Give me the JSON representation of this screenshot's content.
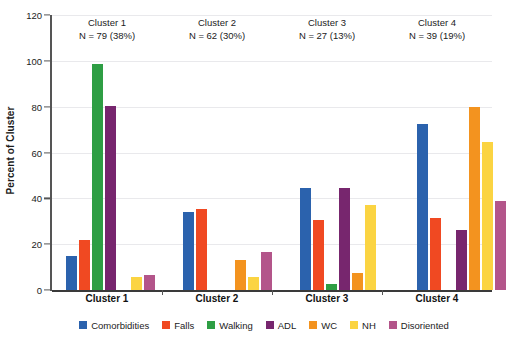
{
  "chart_data": {
    "type": "bar",
    "title": "",
    "subtitle": "",
    "xlabel": "",
    "ylabel": "Percent of Cluster",
    "ylim": [
      0,
      120
    ],
    "yticks": [
      0,
      20,
      40,
      60,
      80,
      100,
      120
    ],
    "grid": true,
    "legend_position": "bottom",
    "categories": [
      "Cluster 1",
      "Cluster 2",
      "Cluster 3",
      "Cluster 4"
    ],
    "annotations": [
      {
        "line1": "Cluster 1",
        "line2": "N = 79 (38%)"
      },
      {
        "line1": "Cluster 2",
        "line2": "N = 62 (30%)"
      },
      {
        "line1": "Cluster 3",
        "line2": "N = 27 (13%)"
      },
      {
        "line1": "Cluster 4",
        "line2": "N = 39 (19%)"
      }
    ],
    "series": [
      {
        "name": "Comorbidities",
        "color": "#2b62ad",
        "values": [
          15.0,
          34.0,
          44.5,
          72.5
        ]
      },
      {
        "name": "Falls",
        "color": "#f04922",
        "values": [
          22.0,
          35.5,
          30.5,
          31.5
        ]
      },
      {
        "name": "Walking",
        "color": "#2e9e44",
        "values": [
          98.5,
          0.0,
          2.5,
          0.0
        ]
      },
      {
        "name": "ADL",
        "color": "#77266e",
        "values": [
          80.5,
          0.0,
          44.5,
          26.0
        ]
      },
      {
        "name": "WC",
        "color": "#f3931f",
        "values": [
          0.0,
          13.0,
          7.5,
          80.0
        ]
      },
      {
        "name": "NH",
        "color": "#fbd442",
        "values": [
          5.5,
          5.5,
          37.0,
          64.5
        ]
      },
      {
        "name": "Disoriented",
        "color": "#b3558a",
        "values": [
          6.5,
          16.5,
          0.0,
          39.0
        ]
      }
    ]
  },
  "axis": {
    "y_title": "Percent of Cluster"
  }
}
